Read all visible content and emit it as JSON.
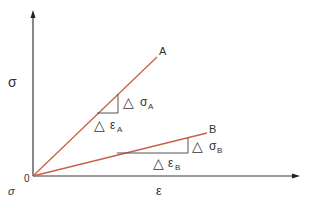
{
  "diagram": {
    "axes": {
      "y_label": "σ",
      "x_label": "ε",
      "origin_label": "0",
      "corner_label": "σ"
    },
    "lines": [
      {
        "name": "A",
        "label": "A",
        "color": "#c8604a"
      },
      {
        "name": "B",
        "label": "B",
        "color": "#c8604a"
      }
    ],
    "annotations": {
      "delta_symbol": "△",
      "sigma_a": "σ",
      "sigma_a_sub": "A",
      "eps_a": "ε",
      "eps_a_sub": "A",
      "sigma_b": "σ",
      "sigma_b_sub": "B",
      "eps_b": "ε",
      "eps_b_sub": "B"
    },
    "colors": {
      "axis": "#3a3a3a",
      "line": "#c8604a",
      "triangle": "#555555",
      "text": "#333333"
    }
  }
}
